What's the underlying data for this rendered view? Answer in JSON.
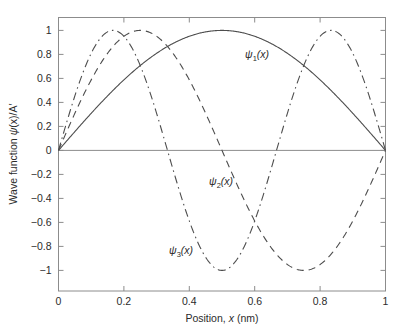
{
  "chart_data": {
    "type": "line",
    "title": "",
    "xlabel": "Position, x (nm)",
    "ylabel": "Wave function ψ(x)/A′",
    "xlim": [
      0,
      1
    ],
    "ylim": [
      -1,
      1
    ],
    "xticks": [
      "0",
      "0.2",
      "0.4",
      "0.6",
      "0.8",
      "1"
    ],
    "xtick_values": [
      0,
      0.2,
      0.4,
      0.6,
      0.8,
      1
    ],
    "yticks": [
      "1",
      "0.8",
      "0.6",
      "0.4",
      "0.2",
      "0",
      "−0.2",
      "−0.4",
      "−0.6",
      "−0.8",
      "−1"
    ],
    "ytick_values": [
      1,
      0.8,
      0.6,
      0.4,
      0.2,
      0,
      -0.2,
      -0.4,
      -0.6,
      -0.8,
      -1
    ],
    "grid": false,
    "legend": "inline-annotations",
    "box": true,
    "series": [
      {
        "name": "ψ₁(x)",
        "formula": "sin(pi*x)",
        "style": "solid",
        "color": "#4d4d4d",
        "x": [
          0,
          0.05,
          0.1,
          0.15,
          0.2,
          0.25,
          0.3,
          0.35,
          0.4,
          0.45,
          0.5,
          0.55,
          0.6,
          0.65,
          0.7,
          0.75,
          0.8,
          0.85,
          0.9,
          0.95,
          1
        ],
        "values": [
          0,
          0.156,
          0.309,
          0.454,
          0.588,
          0.707,
          0.809,
          0.891,
          0.951,
          0.988,
          1,
          0.988,
          0.951,
          0.891,
          0.809,
          0.707,
          0.588,
          0.454,
          0.309,
          0.156,
          0
        ]
      },
      {
        "name": "ψ₂(x)",
        "formula": "sin(2*pi*x)",
        "style": "dashed",
        "color": "#4d4d4d",
        "x": [
          0,
          0.05,
          0.1,
          0.15,
          0.2,
          0.25,
          0.3,
          0.35,
          0.4,
          0.45,
          0.5,
          0.55,
          0.6,
          0.65,
          0.7,
          0.75,
          0.8,
          0.85,
          0.9,
          0.95,
          1
        ],
        "values": [
          0,
          0.309,
          0.588,
          0.809,
          0.951,
          1,
          0.951,
          0.809,
          0.588,
          0.309,
          0,
          -0.309,
          -0.588,
          -0.809,
          -0.951,
          -1,
          -0.951,
          -0.809,
          -0.588,
          -0.309,
          0
        ]
      },
      {
        "name": "ψ₃(x)",
        "formula": "sin(3*pi*x)",
        "style": "dash-dot",
        "color": "#4d4d4d",
        "x": [
          0,
          0.05,
          0.1,
          0.15,
          0.2,
          0.25,
          0.3,
          0.35,
          0.4,
          0.45,
          0.5,
          0.55,
          0.6,
          0.65,
          0.7,
          0.75,
          0.8,
          0.85,
          0.9,
          0.95,
          1
        ],
        "values": [
          0,
          0.454,
          0.809,
          0.988,
          0.951,
          0.707,
          0.309,
          -0.156,
          -0.588,
          -0.891,
          -1,
          -0.891,
          -0.588,
          -0.156,
          0.309,
          0.707,
          0.951,
          0.988,
          0.809,
          0.454,
          0
        ]
      }
    ],
    "annotations": [
      {
        "text": "ψ₁(x)",
        "x": 0.58,
        "y": 0.845,
        "series": "ψ₁(x)"
      },
      {
        "text": "ψ₂(x)",
        "x": 0.46,
        "y": -0.22,
        "series": "ψ₂(x)"
      },
      {
        "text": "ψ₃(x)",
        "x": 0.34,
        "y": -0.79,
        "series": "ψ₃(x)"
      }
    ]
  },
  "labels": {
    "psi1_main": "ψ",
    "psi1_sub": "1",
    "psi2_sub": "2",
    "psi3_sub": "3",
    "paren_x": "(x)",
    "xaxis_prefix": "Position,",
    "xaxis_var": "x",
    "xaxis_unit": "(nm)",
    "yaxis_prefix": "Wave function",
    "yaxis_psi": "ψ",
    "yaxis_rest": "(x)/A′"
  },
  "colors": {
    "axis": "#8c8c8c",
    "curve": "#4d4d4d",
    "text": "#2b2b2b",
    "background": "#ffffff"
  }
}
